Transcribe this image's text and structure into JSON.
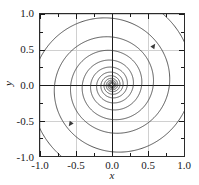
{
  "figure": {
    "background_color": "#ffffff",
    "frame_color": "#2b2b2b",
    "grid_color": "#d0d0d0",
    "axis_line_color": "#1a1a1a",
    "curve_color": "#3a3a3a"
  },
  "axes": {
    "x_title": "x",
    "y_title": "y",
    "x_ticks": [
      "-1.0",
      "-0.5",
      "0.0",
      "0.5",
      "1.0"
    ],
    "y_ticks": [
      "1.0",
      "0.5",
      "0.0",
      "-0.5",
      "-1.0"
    ]
  },
  "chart_data": {
    "type": "line",
    "title": "",
    "xlabel": "x",
    "ylabel": "y",
    "xlim": [
      -1.0,
      1.0
    ],
    "ylim": [
      -1.0,
      1.0
    ],
    "grid": true,
    "grid_spacing": 0.5,
    "minor_tick_spacing": 0.25,
    "major_tick_spacing": 0.5,
    "legend": "none",
    "equilibrium_point": [
      0.0,
      0.0
    ],
    "spiral": {
      "kind": "logarithmic",
      "r_of_theta": "r = r0 * exp(-b * theta)",
      "decay_b": 0.105,
      "direction": "clockwise-inward",
      "turns": 6.2
    },
    "series": [
      {
        "name": "trajectory-1",
        "r0": 1.42,
        "theta0_deg": 135,
        "arrow_at_deg": 40,
        "points_r": [
          1.42,
          1.24,
          1.08,
          0.95,
          0.83,
          0.72,
          0.63,
          0.55,
          0.48,
          0.42,
          0.37,
          0.32,
          0.28,
          0.25,
          0.21,
          0.19,
          0.16,
          0.14,
          0.12,
          0.11,
          0.09,
          0.08,
          0.07,
          0.06,
          0.05,
          0.05,
          0.04,
          0.03,
          0.03,
          0.02,
          0.02,
          0.01,
          0.01,
          0.0
        ]
      },
      {
        "name": "trajectory-2",
        "r0": 1.42,
        "theta0_deg": 315,
        "arrow_at_deg": 220,
        "points_r": [
          1.42,
          1.24,
          1.08,
          0.95,
          0.83,
          0.72,
          0.63,
          0.55,
          0.48,
          0.42,
          0.37,
          0.32,
          0.28,
          0.25,
          0.21,
          0.19,
          0.16,
          0.14,
          0.12,
          0.11,
          0.09,
          0.08,
          0.07,
          0.06,
          0.05,
          0.05,
          0.04,
          0.03,
          0.03,
          0.02,
          0.02,
          0.01,
          0.01,
          0.0
        ]
      }
    ],
    "arrows": [
      {
        "x": 0.6,
        "y": 0.58,
        "angle_deg": -55
      },
      {
        "x": -0.6,
        "y": -0.58,
        "angle_deg": 125
      }
    ]
  }
}
